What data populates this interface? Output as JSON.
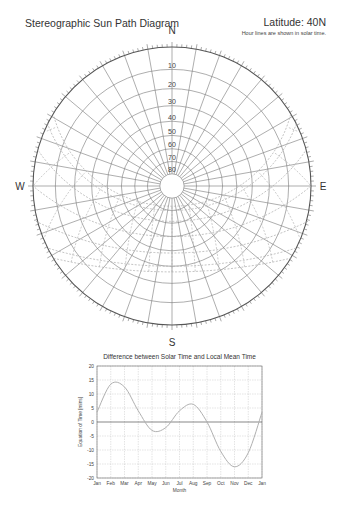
{
  "header": {
    "title": "Stereographic Sun Path Diagram",
    "latitude": "Latitude: 40N",
    "note": "Hour lines are shown in solar time."
  },
  "compass": {
    "north": "N",
    "south": "S",
    "west": "W",
    "east": "E"
  },
  "altitude_labels": [
    "10",
    "20",
    "30",
    "40",
    "50",
    "60",
    "70",
    "80"
  ],
  "colors": {
    "grid": "#777777",
    "sunpath": "#aaaaaa",
    "curve": "#b0b0b0",
    "frame": "#555555"
  },
  "chart_data": [
    {
      "type": "polar",
      "title": "Stereographic Sun Path Diagram",
      "subtitle": "Latitude: 40N — Hour lines are shown in solar time.",
      "altitude_rings": [
        10,
        20,
        30,
        40,
        50,
        60,
        70,
        80
      ],
      "azimuth_step_deg": 10,
      "latitude_deg": 40,
      "directions": [
        "N",
        "E",
        "S",
        "W"
      ]
    },
    {
      "type": "line",
      "title": "Difference between Solar Time and Local Mean Time",
      "xlabel": "Month",
      "ylabel": "Equation of Time [mins]",
      "categories": [
        "Jan",
        "Feb",
        "Mar",
        "Apr",
        "May",
        "Jun",
        "Jul",
        "Aug",
        "Sep",
        "Oct",
        "Nov",
        "Dec",
        "Jan"
      ],
      "yticks": [
        20,
        15,
        10,
        5,
        0,
        -5,
        -10,
        -15,
        -20
      ],
      "ylim": [
        -20,
        20
      ],
      "grid": true,
      "series": [
        {
          "name": "Equation of Time",
          "values": [
            3.5,
            13.5,
            12.5,
            4,
            -3,
            -2,
            4,
            6.3,
            0,
            -10.5,
            -16,
            -11,
            3.5
          ]
        }
      ]
    }
  ],
  "eot_chart": {
    "title": "Difference between Solar Time and Local Mean Time",
    "xlabel": "Month",
    "ylabel": "Equation of Time [mins]"
  }
}
